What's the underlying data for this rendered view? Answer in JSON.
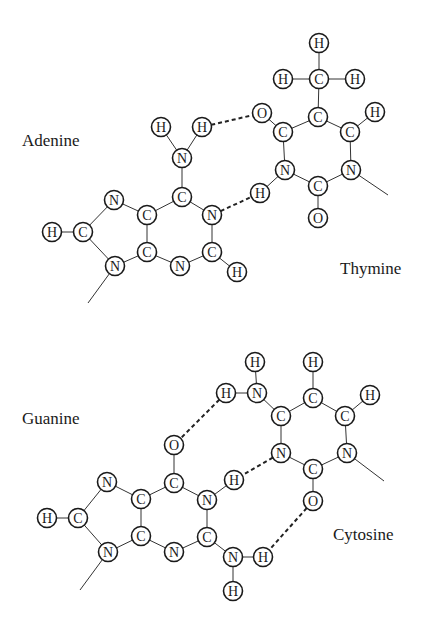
{
  "colors": {
    "ink": "#1a1a1a",
    "background": "#ffffff"
  },
  "labels": {
    "adenine": "Adenine",
    "thymine": "Thymine",
    "guanine": "Guanine",
    "cytosine": "Cytosine"
  },
  "pairs": [
    {
      "name": "adenine-thymine",
      "atoms": [
        {
          "id": "a_h_nh2_l",
          "el": "H",
          "x": 161,
          "y": 127
        },
        {
          "id": "a_h_nh2_r",
          "el": "H",
          "x": 202,
          "y": 127
        },
        {
          "id": "a_n_amine",
          "el": "N",
          "x": 182,
          "y": 158
        },
        {
          "id": "a_c6",
          "el": "C",
          "x": 182,
          "y": 197
        },
        {
          "id": "a_n7",
          "el": "N",
          "x": 114,
          "y": 200
        },
        {
          "id": "a_c5",
          "el": "C",
          "x": 147,
          "y": 215
        },
        {
          "id": "a_n1",
          "el": "N",
          "x": 212,
          "y": 215
        },
        {
          "id": "a_h8",
          "el": "H",
          "x": 52,
          "y": 232
        },
        {
          "id": "a_c8",
          "el": "C",
          "x": 83,
          "y": 232
        },
        {
          "id": "a_c4",
          "el": "C",
          "x": 147,
          "y": 252
        },
        {
          "id": "a_c2",
          "el": "C",
          "x": 212,
          "y": 252
        },
        {
          "id": "a_n9",
          "el": "N",
          "x": 115,
          "y": 266
        },
        {
          "id": "a_n3",
          "el": "N",
          "x": 180,
          "y": 266
        },
        {
          "id": "a_h2",
          "el": "H",
          "x": 237,
          "y": 272
        },
        {
          "id": "t_h_me_t",
          "el": "H",
          "x": 319,
          "y": 43
        },
        {
          "id": "t_h_me_l",
          "el": "H",
          "x": 283,
          "y": 79
        },
        {
          "id": "t_c_me",
          "el": "C",
          "x": 319,
          "y": 79
        },
        {
          "id": "t_h_me_r",
          "el": "H",
          "x": 355,
          "y": 79
        },
        {
          "id": "t_o4",
          "el": "O",
          "x": 262,
          "y": 113
        },
        {
          "id": "t_c5",
          "el": "C",
          "x": 318,
          "y": 117
        },
        {
          "id": "t_h6",
          "el": "H",
          "x": 375,
          "y": 112
        },
        {
          "id": "t_c4",
          "el": "C",
          "x": 283,
          "y": 132
        },
        {
          "id": "t_c6",
          "el": "C",
          "x": 350,
          "y": 132
        },
        {
          "id": "t_n3",
          "el": "N",
          "x": 285,
          "y": 170
        },
        {
          "id": "t_n1",
          "el": "N",
          "x": 351,
          "y": 170
        },
        {
          "id": "t_c2",
          "el": "C",
          "x": 318,
          "y": 186
        },
        {
          "id": "t_h3",
          "el": "H",
          "x": 260,
          "y": 193
        },
        {
          "id": "t_o2",
          "el": "O",
          "x": 318,
          "y": 218
        }
      ],
      "bonds": [
        [
          "a_h_nh2_l",
          "a_n_amine"
        ],
        [
          "a_h_nh2_r",
          "a_n_amine"
        ],
        [
          "a_n_amine",
          "a_c6"
        ],
        [
          "a_c6",
          "a_c5"
        ],
        [
          "a_c6",
          "a_n1"
        ],
        [
          "a_n1",
          "a_c2"
        ],
        [
          "a_c2",
          "a_n3"
        ],
        [
          "a_n3",
          "a_c4"
        ],
        [
          "a_c4",
          "a_c5"
        ],
        [
          "a_c5",
          "a_n7"
        ],
        [
          "a_n7",
          "a_c8"
        ],
        [
          "a_c8",
          "a_n9"
        ],
        [
          "a_n9",
          "a_c4"
        ],
        [
          "a_h8",
          "a_c8"
        ],
        [
          "a_c2",
          "a_h2"
        ],
        [
          "t_h_me_t",
          "t_c_me"
        ],
        [
          "t_h_me_l",
          "t_c_me"
        ],
        [
          "t_h_me_r",
          "t_c_me"
        ],
        [
          "t_c_me",
          "t_c5"
        ],
        [
          "t_c5",
          "t_c4"
        ],
        [
          "t_c5",
          "t_c6"
        ],
        [
          "t_c6",
          "t_h6"
        ],
        [
          "t_c4",
          "t_o4"
        ],
        [
          "t_c4",
          "t_n3"
        ],
        [
          "t_c6",
          "t_n1"
        ],
        [
          "t_n3",
          "t_c2"
        ],
        [
          "t_n1",
          "t_c2"
        ],
        [
          "t_c2",
          "t_o2"
        ],
        [
          "t_n3",
          "t_h3"
        ]
      ],
      "hbonds": [
        [
          "a_h_nh2_r",
          "t_o4"
        ],
        [
          "a_n1",
          "t_h3"
        ]
      ],
      "tails": [
        [
          115,
          266,
          88,
          303
        ],
        [
          351,
          170,
          388,
          195
        ]
      ]
    },
    {
      "name": "guanine-cytosine",
      "atoms": [
        {
          "id": "c_h_nh2_t",
          "el": "H",
          "x": 255,
          "y": 362
        },
        {
          "id": "c_h_c5",
          "el": "H",
          "x": 313,
          "y": 362
        },
        {
          "id": "c_h_nh2_l",
          "el": "H",
          "x": 226,
          "y": 393
        },
        {
          "id": "c_n4",
          "el": "N",
          "x": 257,
          "y": 393
        },
        {
          "id": "c_c5",
          "el": "C",
          "x": 313,
          "y": 398
        },
        {
          "id": "c_h6",
          "el": "H",
          "x": 370,
          "y": 395
        },
        {
          "id": "c_c4",
          "el": "C",
          "x": 281,
          "y": 416
        },
        {
          "id": "c_c6",
          "el": "C",
          "x": 345,
          "y": 416
        },
        {
          "id": "c_n3",
          "el": "N",
          "x": 281,
          "y": 453
        },
        {
          "id": "c_n1",
          "el": "N",
          "x": 347,
          "y": 453
        },
        {
          "id": "c_c2",
          "el": "C",
          "x": 313,
          "y": 469
        },
        {
          "id": "c_o2",
          "el": "O",
          "x": 313,
          "y": 501
        },
        {
          "id": "g_o6",
          "el": "O",
          "x": 174,
          "y": 445
        },
        {
          "id": "g_n7",
          "el": "N",
          "x": 107,
          "y": 482
        },
        {
          "id": "g_c6",
          "el": "C",
          "x": 174,
          "y": 483
        },
        {
          "id": "g_h1",
          "el": "H",
          "x": 234,
          "y": 480
        },
        {
          "id": "g_c5",
          "el": "C",
          "x": 141,
          "y": 499
        },
        {
          "id": "g_n1",
          "el": "N",
          "x": 207,
          "y": 500
        },
        {
          "id": "g_h8",
          "el": "H",
          "x": 47,
          "y": 518
        },
        {
          "id": "g_c8",
          "el": "C",
          "x": 78,
          "y": 518
        },
        {
          "id": "g_c4",
          "el": "C",
          "x": 141,
          "y": 536
        },
        {
          "id": "g_c2",
          "el": "C",
          "x": 207,
          "y": 537
        },
        {
          "id": "g_n9",
          "el": "N",
          "x": 108,
          "y": 552
        },
        {
          "id": "g_n3",
          "el": "N",
          "x": 174,
          "y": 552
        },
        {
          "id": "g_n_amine",
          "el": "N",
          "x": 233,
          "y": 557
        },
        {
          "id": "g_h_nh2_r",
          "el": "H",
          "x": 263,
          "y": 557
        },
        {
          "id": "g_h_nh2_b",
          "el": "H",
          "x": 233,
          "y": 591
        }
      ],
      "bonds": [
        [
          "c_h_nh2_t",
          "c_n4"
        ],
        [
          "c_h_nh2_l",
          "c_n4"
        ],
        [
          "c_n4",
          "c_c4"
        ],
        [
          "c_c4",
          "c_c5"
        ],
        [
          "c_c5",
          "c_h_c5"
        ],
        [
          "c_c5",
          "c_c6"
        ],
        [
          "c_c6",
          "c_h6"
        ],
        [
          "c_c4",
          "c_n3"
        ],
        [
          "c_c6",
          "c_n1"
        ],
        [
          "c_n3",
          "c_c2"
        ],
        [
          "c_n1",
          "c_c2"
        ],
        [
          "c_c2",
          "c_o2"
        ],
        [
          "g_o6",
          "g_c6"
        ],
        [
          "g_c6",
          "g_c5"
        ],
        [
          "g_c6",
          "g_n1"
        ],
        [
          "g_n1",
          "g_h1"
        ],
        [
          "g_n1",
          "g_c2"
        ],
        [
          "g_c2",
          "g_n3"
        ],
        [
          "g_n3",
          "g_c4"
        ],
        [
          "g_c4",
          "g_c5"
        ],
        [
          "g_c5",
          "g_n7"
        ],
        [
          "g_n7",
          "g_c8"
        ],
        [
          "g_c8",
          "g_n9"
        ],
        [
          "g_n9",
          "g_c4"
        ],
        [
          "g_h8",
          "g_c8"
        ],
        [
          "g_c2",
          "g_n_amine"
        ],
        [
          "g_n_amine",
          "g_h_nh2_r"
        ],
        [
          "g_n_amine",
          "g_h_nh2_b"
        ]
      ],
      "hbonds": [
        [
          "c_h_nh2_l",
          "g_o6"
        ],
        [
          "c_n3",
          "g_h1"
        ],
        [
          "c_o2",
          "g_h_nh2_r"
        ]
      ],
      "tails": [
        [
          108,
          552,
          80,
          590
        ],
        [
          347,
          453,
          384,
          481
        ]
      ]
    }
  ]
}
